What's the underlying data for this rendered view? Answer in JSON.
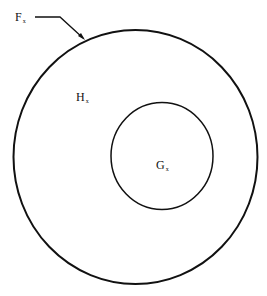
{
  "diagram": {
    "type": "nested-sets",
    "outer_set": {
      "label": "F",
      "subscript": "x"
    },
    "region": {
      "label": "H",
      "subscript": "x"
    },
    "inner_set": {
      "label": "G",
      "subscript": "x"
    },
    "stroke_color": "#111111",
    "background": "#ffffff"
  }
}
